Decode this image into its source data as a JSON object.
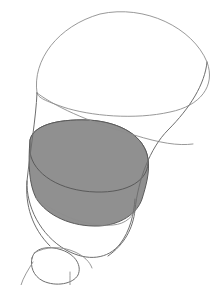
{
  "document": {
    "type": "line-drawing",
    "title": "Shaded vessel cross-section sketch",
    "canvas": {
      "width": 219,
      "height": 285,
      "background": "#ffffff"
    },
    "has_text": false,
    "visible_text": ""
  },
  "palette": {
    "background": "#ffffff",
    "outline": "#6e6e6e",
    "outline_faint": "#8d8d8d",
    "outline_dark": "#4e4e4e",
    "shade_fill": "#909090",
    "shade_outline": "#5a5a5a"
  },
  "shapes": [
    {
      "id": "upper-rim-ellipse",
      "name": "upper-rim-ellipse",
      "role": "open mouth of vessel drawn in perspective",
      "fill": "none",
      "stroke": "#8d8d8d",
      "path": "M 37 93 C 32 60 58 26 100 14 C 145 4 193 28 207 62 C 216 86 200 106 170 112 C 135 120 90 116 63 107 C 46 101 38 98 37 93 Z"
    },
    {
      "id": "body-left-wall",
      "name": "body-left-wall",
      "role": "left outer contour of the flaring body",
      "fill": "none",
      "stroke": "#6e6e6e",
      "path": "M 37 93 C 36 118 30 152 27 181 C 25 205 32 228 50 246"
    },
    {
      "id": "body-right-wall",
      "name": "body-right-wall",
      "role": "right outer contour descending from the rim",
      "fill": "none",
      "stroke": "#6e6e6e",
      "path": "M 207 62 C 205 84 190 108 168 130 C 150 148 138 180 135 210 C 133 228 125 244 108 256"
    },
    {
      "id": "inner-wall-crossing",
      "name": "inner-wall-crossing",
      "role": "inner far wall seen through the open mouth",
      "fill": "none",
      "stroke": "#8d8d8d",
      "path": "M 37 93 C 60 110 96 124 134 135 C 160 143 178 146 193 144"
    },
    {
      "id": "liquid-surface-ellipse",
      "name": "liquid-surface-ellipse",
      "role": "shaded elliptical fill level surface",
      "fill": "#909090",
      "stroke": "#5a5a5a",
      "path": "M 30 140 C 33 126 55 119 88 120 C 122 122 145 137 148 159 C 150 180 128 193 96 192 C 60 191 33 174 30 152 Z"
    },
    {
      "id": "liquid-body-shade",
      "name": "liquid-body-shade",
      "role": "shaded wall of the filled volume below the surface",
      "fill": "#909090",
      "stroke": "#5a5a5a",
      "path": "M 30 140 C 33 126 55 119 88 120 C 122 122 145 137 148 159 C 150 172 146 186 142 199 C 137 214 120 225 99 226 C 72 227 47 216 36 198 C 29 184 28 164 30 140 Z"
    },
    {
      "id": "lower-bowl-contour",
      "name": "lower-bowl-contour",
      "role": "rounded underside of the bowl below the shaded fill",
      "fill": "none",
      "stroke": "#6e6e6e",
      "path": "M 27 181 C 26 206 40 235 66 250 C 88 262 108 259 120 244 C 130 231 134 214 135 199"
    },
    {
      "id": "bowl-base-seam",
      "name": "bowl-base-seam",
      "role": "seam line across the underside of the bowl",
      "fill": "none",
      "stroke": "#8d8d8d",
      "path": "M 36 198 C 58 216 88 227 113 225 C 126 224 134 216 137 206"
    },
    {
      "id": "foot-bulb-ellipse",
      "name": "foot-bulb-ellipse",
      "role": "small rounded knop at the base",
      "fill": "none",
      "stroke": "#6e6e6e",
      "path": "M 32 258 C 34 248 48 245 62 250 C 76 255 82 266 78 275 C 73 284 56 287 43 281 C 33 276 30 266 32 258 Z"
    },
    {
      "id": "foot-stem-left",
      "name": "foot-stem-left",
      "role": "left stem line running off the bottom edge",
      "fill": "none",
      "stroke": "#8d8d8d",
      "path": "M 33 262 C 28 270 23 278 21 285"
    },
    {
      "id": "foot-stem-right",
      "name": "foot-stem-right",
      "role": "right stem line running off the bottom edge",
      "fill": "none",
      "stroke": "#8d8d8d",
      "path": "M 70 272 C 70 277 70 281 70 285"
    },
    {
      "id": "foot-bulb-top-seam",
      "name": "foot-bulb-top-seam",
      "role": "upper seam of the base knop meeting the bowl",
      "fill": "none",
      "stroke": "#8d8d8d",
      "path": "M 34 253 C 46 246 62 246 75 252 C 84 256 90 262 92 268"
    }
  ]
}
